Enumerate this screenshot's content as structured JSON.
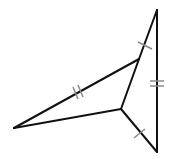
{
  "diagram": {
    "type": "geometry-figure",
    "colors": {
      "edge": "#111111",
      "tick": "#8a8a8a",
      "background": "#ffffff"
    },
    "vertices": {
      "top": [
        157,
        10
      ],
      "bottom": [
        157,
        152
      ],
      "left": [
        14,
        128
      ],
      "center": [
        121,
        109
      ],
      "upper": [
        139,
        59
      ]
    },
    "edges": [
      {
        "name": "top-upper",
        "from": "top",
        "to": "upper",
        "ticks": 1
      },
      {
        "name": "upper-left",
        "from": "upper",
        "to": "left",
        "ticks": 2
      },
      {
        "name": "left-center",
        "from": "left",
        "to": "center",
        "ticks": 0
      },
      {
        "name": "center-upper",
        "from": "center",
        "to": "upper",
        "ticks": 0
      },
      {
        "name": "center-bottom",
        "from": "center",
        "to": "bottom",
        "ticks": 1
      },
      {
        "name": "top-bottom",
        "from": "top",
        "to": "bottom",
        "ticks": 2
      }
    ]
  }
}
